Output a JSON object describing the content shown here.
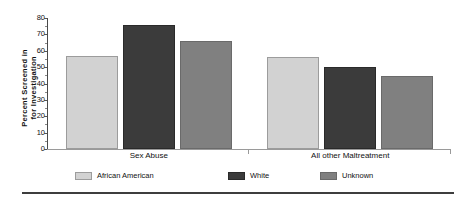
{
  "chart_data": {
    "type": "bar",
    "title": "",
    "subtitle": "",
    "xlabel": "",
    "ylabel": "Percent Screened in for Investigation",
    "ylabel_lines": [
      "Percent Screened in",
      "for Investigation"
    ],
    "ylim": [
      0,
      80
    ],
    "ytick_step": 10,
    "ytick_labels": [
      "0",
      "10",
      "20",
      "30",
      "40",
      "50",
      "60",
      "70",
      "80"
    ],
    "ytick_values": [
      0,
      10,
      20,
      30,
      40,
      50,
      60,
      70,
      80
    ],
    "grid": false,
    "legend_position": "bottom",
    "categories": [
      "Sex Abuse",
      "All other Maltreatment"
    ],
    "series": [
      {
        "name": "African American",
        "color": "#d2d2d2",
        "values": [
          56.5,
          56.0
        ]
      },
      {
        "name": "White",
        "color": "#3b3b3b",
        "values": [
          76.0,
          50.0
        ]
      },
      {
        "name": "Unknown",
        "color": "#808080",
        "values": [
          66.0,
          44.5
        ]
      }
    ]
  },
  "legend": {
    "items": [
      {
        "label": "African American",
        "swatch_class": "c-aa"
      },
      {
        "label": "White",
        "swatch_class": "c-wh"
      },
      {
        "label": "Unknown",
        "swatch_class": "c-un"
      }
    ]
  },
  "axis": {
    "y_title_line1": "Percent Screened in",
    "y_title_line2": "for Investigation"
  }
}
